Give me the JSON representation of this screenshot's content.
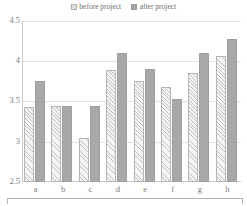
{
  "legend": {
    "position": "top-center",
    "entries": [
      {
        "label": "before project",
        "marker": "hatched-square-icon",
        "color": "#f2f2f2"
      },
      {
        "label": "after project",
        "marker": "solid-square-icon",
        "color": "#a6a6a6"
      }
    ]
  },
  "axes": {
    "y_ticks": [
      "4.5",
      "4",
      "3.5",
      "3",
      "2.5"
    ],
    "x_ticks": [
      "a",
      "b",
      "c",
      "d",
      "e",
      "f",
      "g",
      "h"
    ]
  },
  "chart_data": {
    "type": "bar",
    "title": "",
    "subtitle": "",
    "xlabel": "",
    "ylabel": "",
    "categories": [
      "a",
      "b",
      "c",
      "d",
      "e",
      "f",
      "g",
      "h"
    ],
    "series": [
      {
        "name": "before project",
        "color": "#f2f2f2",
        "pattern": "diagonal-hatch",
        "values": [
          3.43,
          3.45,
          3.05,
          3.89,
          3.75,
          3.68,
          3.85,
          4.06
        ]
      },
      {
        "name": "after project",
        "color": "#a6a6a6",
        "pattern": "solid",
        "values": [
          3.75,
          3.45,
          3.45,
          4.1,
          3.9,
          3.53,
          4.1,
          4.28
        ]
      }
    ],
    "ylim": [
      2.5,
      4.5
    ],
    "ytick_step": 0.5,
    "ytick_labels": [
      "2.5",
      "3",
      "3.5",
      "4",
      "4.5"
    ],
    "grid": true,
    "grid_axis": "y",
    "legend": true,
    "legend_position": "top-center"
  }
}
